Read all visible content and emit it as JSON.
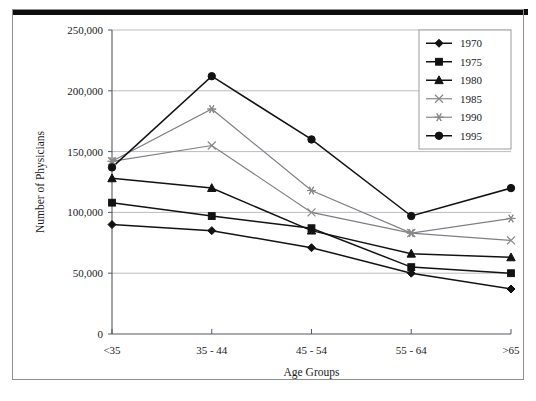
{
  "figure": {
    "has_scan_bar": true,
    "border_color": "#8d8f94",
    "background": "#ffffff"
  },
  "chart_data": {
    "type": "line",
    "title": "",
    "xlabel": "Age Groups",
    "ylabel": "Number of Physicians",
    "categories": [
      "<35",
      "35 - 44",
      "45 - 54",
      "55 - 64",
      ">65"
    ],
    "ylim": [
      0,
      250000
    ],
    "ytick_values": [
      0,
      50000,
      100000,
      150000,
      200000,
      250000
    ],
    "ytick_labels": [
      "0",
      "50,000",
      "100,000",
      "150,000",
      "200,000",
      "250,000"
    ],
    "grid": "horizontal",
    "legend_position": "top-right",
    "series": [
      {
        "name": "1970",
        "marker": "diamond",
        "color": "#111111",
        "values": [
          90000,
          85000,
          71000,
          50000,
          37000
        ]
      },
      {
        "name": "1975",
        "marker": "square",
        "color": "#111111",
        "values": [
          108000,
          97000,
          87000,
          55000,
          50000
        ]
      },
      {
        "name": "1980",
        "marker": "triangle",
        "color": "#111111",
        "values": [
          128000,
          120000,
          85000,
          66000,
          63000
        ]
      },
      {
        "name": "1985",
        "marker": "x",
        "color": "#8a8a8a",
        "values": [
          142000,
          155000,
          100000,
          83000,
          77000
        ]
      },
      {
        "name": "1990",
        "marker": "asterisk",
        "color": "#8a8a8a",
        "values": [
          142000,
          185000,
          118000,
          83000,
          95000
        ]
      },
      {
        "name": "1995",
        "marker": "circle",
        "color": "#111111",
        "values": [
          137000,
          212000,
          160000,
          97000,
          120000
        ]
      }
    ]
  }
}
